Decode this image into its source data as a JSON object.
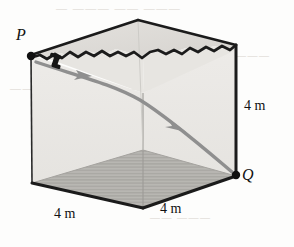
{
  "figure": {
    "points": [
      {
        "id": "P",
        "label": "P",
        "description": "launch point at top rear-left corner of box"
      },
      {
        "id": "Q",
        "label": "Q",
        "description": "landing point at bottom front-right corner of box"
      }
    ],
    "dimensions": [
      {
        "id": "height",
        "label": "4 m",
        "edge": "right vertical edge"
      },
      {
        "id": "width-left",
        "label": "4 m",
        "edge": "bottom left edge"
      },
      {
        "id": "depth-right",
        "label": "4 m",
        "edge": "bottom right edge"
      }
    ],
    "path": {
      "description": "curved trajectory arrow from P to Q",
      "arrow_count": 2,
      "color": "#8c8c8c"
    },
    "colors": {
      "outline": "#1b1b1b",
      "wall_fill": "#e9e7e4",
      "top_fill": "#dedbd7",
      "floor_fill": "#b8b6b2",
      "path": "#8c8c8c",
      "background": "#fdfdfc",
      "ghost_text": "#d8d3cd"
    }
  },
  "ghost_text": {
    "top": "— ——— —— ———",
    "middle": "————— —— —————",
    "right": "———",
    "bottom": "—— ———"
  }
}
